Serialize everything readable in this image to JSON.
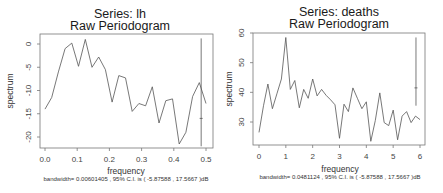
{
  "chart_data": [
    {
      "type": "line",
      "title": "Series:  lh",
      "subtitle": "Raw Periodogram",
      "xlabel": "frequency",
      "ylabel": "spectrum",
      "footnote": "bandwidth= 0.00601405 , 95% C.I. is ( -5.87588 , 17.5667 )dB",
      "xlim": [
        0.0,
        0.5
      ],
      "ylim": [
        -22,
        1.5
      ],
      "x_ticks": [
        "0.0",
        "0.1",
        "0.2",
        "0.3",
        "0.4",
        "0.5"
      ],
      "y_ticks": [
        "0",
        "-5",
        "-10",
        "-15",
        "-20"
      ],
      "grid": false,
      "x": [
        0.0208,
        0.0417,
        0.0625,
        0.0833,
        0.1042,
        0.125,
        0.1458,
        0.1667,
        0.1875,
        0.2083,
        0.2292,
        0.25,
        0.2708,
        0.2917,
        0.3125,
        0.3333,
        0.3542,
        0.375,
        0.3958,
        0.4167,
        0.4375,
        0.4583,
        0.4792,
        0.5
      ],
      "values": [
        -14.0,
        -11.5,
        -6.0,
        -1.0,
        0.2,
        -4.8,
        1.0,
        -5.0,
        -2.8,
        -5.5,
        -12.5,
        -6.8,
        -7.3,
        -14.5,
        -12.8,
        -13.3,
        -9.2,
        -17.0,
        -12.2,
        -11.8,
        -21.5,
        -19.0,
        -11.3,
        -8.3,
        -12.8
      ],
      "ci_bar": {
        "x": 0.485,
        "ymin": -22.0,
        "ymax": 1.2,
        "center": -16.0
      }
    },
    {
      "type": "line",
      "title": "Series:  deaths",
      "subtitle": "Raw Periodogram",
      "xlabel": "frequency",
      "ylabel": "spectrum",
      "footnote": "bandwidth= 0.0481124 , 95% C.I. is ( -5.87588 , 17.5667 )dB",
      "xlim": [
        0,
        6
      ],
      "ylim": [
        22,
        60
      ],
      "x_ticks": [
        "0",
        "1",
        "2",
        "3",
        "4",
        "5",
        "6"
      ],
      "y_ticks": [
        "30",
        "40",
        "50",
        "60"
      ],
      "grid": false,
      "x": [
        0.0,
        0.1667,
        0.3333,
        0.5,
        0.6667,
        0.8333,
        1.0,
        1.1667,
        1.3333,
        1.5,
        1.6667,
        1.8333,
        2.0,
        2.1667,
        2.3333,
        2.5,
        2.6667,
        2.8333,
        3.0,
        3.1667,
        3.3333,
        3.5,
        3.6667,
        3.8333,
        4.0,
        4.1667,
        4.3333,
        4.5,
        4.6667,
        4.8333,
        5.0,
        5.1667,
        5.3333,
        5.5,
        5.6667,
        5.8333,
        6.0
      ],
      "values": [
        26.5,
        35.5,
        42.8,
        34.5,
        39.5,
        44.5,
        58.5,
        41.0,
        44.0,
        34.8,
        41.0,
        38.0,
        44.5,
        38.8,
        41.0,
        39.0,
        37.5,
        35.8,
        24.5,
        36.0,
        33.5,
        41.5,
        38.0,
        34.5,
        36.8,
        23.5,
        30.5,
        39.8,
        29.8,
        28.8,
        34.0,
        24.0,
        32.0,
        33.5,
        29.8,
        32.0,
        30.8
      ],
      "ci_bar": {
        "x": 5.85,
        "ymin": 35.5,
        "ymax": 58.5,
        "center": 41.5
      }
    }
  ]
}
